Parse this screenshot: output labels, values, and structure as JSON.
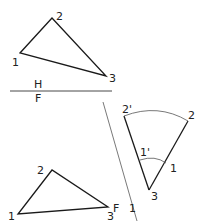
{
  "diagram": {
    "plane_labels": {
      "top": "H",
      "bottom": "F"
    },
    "fold_label": "F",
    "fold_label_2": "1",
    "top_view": {
      "p1": "1",
      "p2": "2",
      "p3": "3"
    },
    "front_view": {
      "p1": "1",
      "p2": "2",
      "p3": "3"
    },
    "revolved_view": {
      "p2": "2",
      "p2_prime": "2'",
      "p1": "1",
      "p1_prime": "1'",
      "p3": "3"
    },
    "colors": {
      "line": "#1a1a1a",
      "thin": "#555555"
    }
  }
}
